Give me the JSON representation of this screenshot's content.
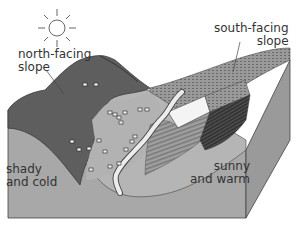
{
  "diagram": {
    "labels": {
      "north_facing": [
        "north-facing",
        "slope"
      ],
      "south_facing": [
        "south-facing",
        "slope"
      ],
      "shady": [
        "shady",
        "and cold"
      ],
      "sunny": [
        "sunny",
        "and warm"
      ]
    },
    "icons": {
      "sun": "sun-icon",
      "sheep": "sheep-icon",
      "river": "river"
    },
    "colors": {
      "dark_slope": "#5e5e5e",
      "light_pasture": "#b4b4b4",
      "block_side": "#a6a6a6",
      "river": "#e8e8e8",
      "field_hatch": "#8c8c8c",
      "outline": "#333333"
    }
  }
}
